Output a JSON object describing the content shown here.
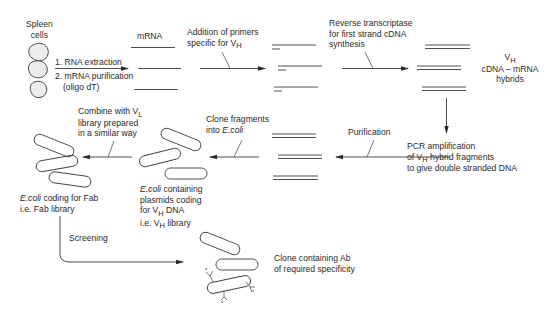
{
  "diagram": {
    "colors": {
      "stroke": "#3a3a3a",
      "text": "#2a2a2a",
      "background": "#ffffff"
    },
    "nodes": {
      "spleen": {
        "line1": "Spleen",
        "line2": "cells"
      },
      "mrna": {
        "label": "mRNA"
      },
      "hybrids": {
        "v": "V",
        "v_sub": "H",
        "line2": "cDNA – mRNA",
        "line3": "hybrids"
      },
      "pcr": {
        "line1": "PCR amplification",
        "line2a": "of V",
        "line2_sub": "H",
        "line2b": " hybrid fragments",
        "line3": "to give double stranded DNA"
      },
      "ecoli_vh": {
        "line1_italic": "E.coli",
        "line1b": " containing",
        "line2": "plasmids coding",
        "line3a": "for V",
        "line3_sub": "H",
        "line3b": " DNA",
        "line4a": "i.e. V",
        "line4_sub": "H",
        "line4b": " library"
      },
      "ecoli_fab": {
        "line1_italic": "E.coli",
        "line1b": " coding for Fab",
        "line2": "i.e. Fab library"
      },
      "clone": {
        "line1": "Clone containing Ab",
        "line2": "of required specificity"
      }
    },
    "steps": {
      "extraction": {
        "line1": "1. RNA extraction",
        "line2": "2. mRNA purification",
        "line3": "(oligo dT)"
      },
      "primers": {
        "line1": "Addition of primers",
        "line2a": "specific for V",
        "line2_sub": "H"
      },
      "reverse_transcriptase": {
        "line1": "Reverse transcriptase",
        "line2": "for first strand cDNA",
        "line3": "synthesis"
      },
      "purification": {
        "label": "Purification"
      },
      "clone_fragments": {
        "line1": "Clone fragments",
        "line2a": "into ",
        "line2_italic": "E.coli"
      },
      "combine_vl": {
        "line1a": "Combine with V",
        "line1_sub": "L",
        "line2": "library prepared",
        "line3": "in a similar way"
      },
      "screening": {
        "label": "Screening"
      }
    }
  }
}
